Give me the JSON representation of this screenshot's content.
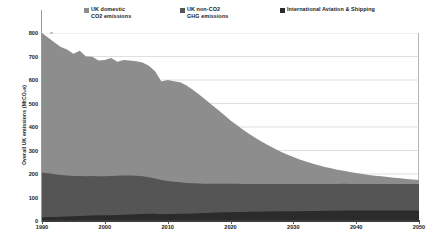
{
  "chart_data": {
    "type": "area",
    "stacked": true,
    "title": "",
    "xlabel": "",
    "ylabel": "Overall UK emissions (MtCO₂e)",
    "xlim": [
      1990,
      2050
    ],
    "ylim": [
      0,
      800
    ],
    "grid": true,
    "grid_axis": "y",
    "legend_position": "top",
    "xticks": [
      1990,
      2000,
      2010,
      2020,
      2030,
      2040,
      2050
    ],
    "yticks": [
      0,
      100,
      200,
      300,
      400,
      500,
      600,
      700,
      800
    ],
    "x": [
      1990,
      1991,
      1992,
      1993,
      1994,
      1995,
      1996,
      1997,
      1998,
      1999,
      2000,
      2001,
      2002,
      2003,
      2004,
      2005,
      2006,
      2007,
      2008,
      2009,
      2010,
      2011,
      2012,
      2013,
      2014,
      2015,
      2016,
      2017,
      2018,
      2019,
      2020,
      2021,
      2022,
      2023,
      2024,
      2025,
      2026,
      2027,
      2028,
      2029,
      2030,
      2031,
      2032,
      2033,
      2034,
      2035,
      2036,
      2037,
      2038,
      2039,
      2040,
      2041,
      2042,
      2043,
      2044,
      2045,
      2046,
      2047,
      2048,
      2049,
      2050
    ],
    "series": [
      {
        "name": "International Aviation & Shipping",
        "color": "#2b2b2b",
        "stack_order": 1,
        "values": [
          16,
          17,
          17,
          18,
          19,
          20,
          21,
          22,
          23,
          24,
          25,
          25,
          26,
          27,
          28,
          29,
          30,
          31,
          31,
          29,
          30,
          30,
          31,
          31,
          32,
          33,
          34,
          35,
          36,
          37,
          37,
          38,
          38,
          39,
          39,
          40,
          40,
          41,
          41,
          42,
          42,
          42,
          43,
          43,
          43,
          44,
          44,
          44,
          45,
          45,
          45,
          45,
          45,
          45,
          45,
          45,
          45,
          45,
          45,
          45,
          45
        ]
      },
      {
        "name": "UK non-CO2 GHG emissions",
        "color": "#555555",
        "stack_order": 2,
        "values": [
          190,
          186,
          182,
          178,
          175,
          172,
          170,
          168,
          168,
          166,
          165,
          166,
          167,
          167,
          166,
          164,
          160,
          155,
          150,
          145,
          140,
          137,
          134,
          131,
          129,
          127,
          125,
          124,
          123,
          122,
          121,
          120,
          119,
          118,
          118,
          117,
          117,
          116,
          116,
          115,
          115,
          115,
          114,
          114,
          114,
          113,
          113,
          113,
          113,
          112,
          112,
          112,
          112,
          112,
          112,
          112,
          112,
          112,
          112,
          112,
          112
        ]
      },
      {
        "name": "UK domestic CO2 emissions",
        "color": "#8d8d8d",
        "stack_order": 3,
        "values": [
          594,
          577,
          561,
          544,
          536,
          520,
          534,
          510,
          508,
          493,
          495,
          503,
          485,
          491,
          489,
          487,
          484,
          475,
          456,
          420,
          430,
          428,
          425,
          415,
          398,
          378,
          358,
          336,
          314,
          292,
          270,
          250,
          231,
          213,
          196,
          180,
          165,
          151,
          138,
          126,
          115,
          105,
          96,
          88,
          80,
          73,
          67,
          61,
          56,
          51,
          47,
          43,
          39,
          36,
          33,
          30,
          27,
          25,
          22,
          20,
          18
        ]
      }
    ],
    "totals_note": {
      "1990": 800,
      "2010": 600,
      "2030": 277,
      "2050": 175
    }
  },
  "legend": {
    "items": [
      {
        "label": "UK domestic\n   CO2 emissions",
        "color": "#8d8d8d"
      },
      {
        "label": "UK non-CO2\n   GHG emissions",
        "color": "#555555"
      },
      {
        "label": "International Aviation & Shipping",
        "color": "#2b2b2b"
      }
    ]
  },
  "axes": {
    "ylabel": "Overall UK emissions (MtCO₂e)",
    "yticks": [
      "800",
      "700",
      "600",
      "500",
      "400",
      "300",
      "200",
      "100",
      "0"
    ],
    "xticks": [
      "1990",
      "2000",
      "2010",
      "2020",
      "2030",
      "2040",
      "2050"
    ]
  }
}
